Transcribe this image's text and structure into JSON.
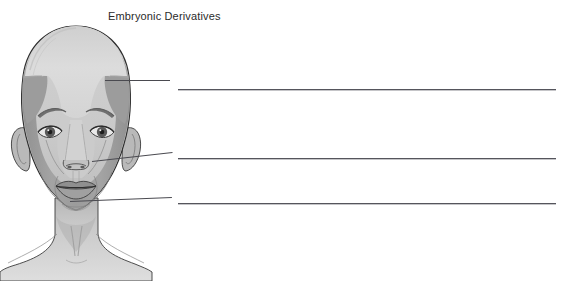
{
  "figure": {
    "title": "Embryonic Derivatives"
  },
  "colors": {
    "background": "#ffffff",
    "title_text": "#2b2b2b",
    "line_stroke": "#55555c",
    "leader_stroke": "#4a4a50",
    "outline": "#2e2e2e",
    "region_light": "#d9d9d9",
    "region_light_2": "#cfcfcf",
    "region_mid": "#b2b2b2",
    "region_dark": "#9a9a9a",
    "region_darker": "#8a8a8a",
    "neck_tone": "#c4c4c4",
    "shadow_tone": "#7e7e7e",
    "hair_tone": "#bdbdbd"
  },
  "annotations": [
    {
      "id": "callout-1",
      "region": "upper-forehead",
      "leader": {
        "x1": 105,
        "y1": 80,
        "x2": 170,
        "y2": 80
      },
      "answer_line": {
        "x": 178,
        "y": 89,
        "width": 378
      },
      "label": "",
      "placeholder": ""
    },
    {
      "id": "callout-2",
      "region": "mid-face-maxillary",
      "leader": {
        "x1": 92,
        "y1": 161,
        "x2": 172,
        "y2": 152
      },
      "answer_line": {
        "x": 178,
        "y": 158,
        "width": 378
      },
      "label": "",
      "placeholder": ""
    },
    {
      "id": "callout-3",
      "region": "lower-jaw-mandibular",
      "leader": {
        "x1": 70,
        "y1": 201,
        "x2": 172,
        "y2": 197
      },
      "answer_line": {
        "x": 178,
        "y": 203,
        "width": 378
      },
      "label": "",
      "placeholder": ""
    }
  ],
  "answer_lines_count": 3
}
